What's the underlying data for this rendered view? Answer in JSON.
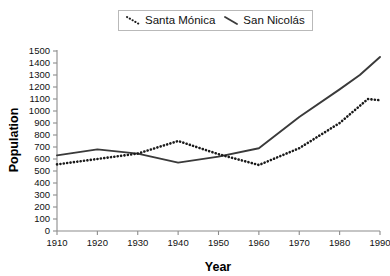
{
  "chart_data": {
    "type": "line",
    "title": "",
    "xlabel": "Year",
    "ylabel": "Population",
    "xlim": [
      1910,
      1990
    ],
    "ylim": [
      0,
      1500
    ],
    "xticks": [
      1910,
      1920,
      1930,
      1940,
      1950,
      1960,
      1970,
      1980,
      1990
    ],
    "yticks": [
      0,
      100,
      200,
      300,
      400,
      500,
      600,
      700,
      800,
      900,
      1000,
      1100,
      1200,
      1300,
      1400,
      1500
    ],
    "grid": false,
    "legend_position": "top-center",
    "series": [
      {
        "name": "Santa Mónica",
        "style": "dotted",
        "color": "#1a1a1a",
        "x": [
          1910,
          1920,
          1930,
          1940,
          1950,
          1960,
          1970,
          1980,
          1987,
          1990
        ],
        "values": [
          555,
          600,
          645,
          750,
          640,
          550,
          690,
          900,
          1100,
          1090
        ]
      },
      {
        "name": "San Nicolás",
        "style": "solid",
        "color": "#3a3a3a",
        "x": [
          1910,
          1920,
          1930,
          1940,
          1950,
          1960,
          1970,
          1980,
          1985,
          1990
        ],
        "values": [
          630,
          680,
          645,
          570,
          620,
          690,
          950,
          1180,
          1300,
          1450
        ]
      }
    ]
  },
  "legend": {
    "entries": [
      {
        "label": "Santa Mónica",
        "marker": "dotted-line-swatch"
      },
      {
        "label": "San Nicolás",
        "marker": "solid-line-swatch"
      }
    ]
  },
  "axes": {
    "x_title": "Year",
    "y_title": "Population",
    "x_tick_labels": [
      "1910",
      "1920",
      "1930",
      "1940",
      "1950",
      "1960",
      "1970",
      "1980",
      "1990"
    ],
    "y_tick_labels": [
      "1500",
      "1400",
      "1300",
      "1200",
      "1100",
      "1000",
      "900",
      "800",
      "700",
      "600",
      "500",
      "400",
      "300",
      "200",
      "100",
      "0"
    ]
  },
  "colors": {
    "axis": "#8c8c8c",
    "series_dotted": "#1a1a1a",
    "series_solid": "#3a3a3a",
    "text": "#111111",
    "legend_border": "#b9b9b9"
  }
}
